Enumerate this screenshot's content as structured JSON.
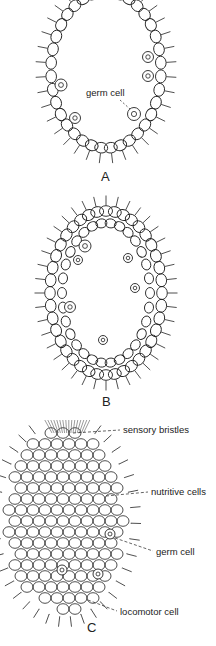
{
  "figures": [
    {
      "id": "A",
      "letter": "A",
      "labels": [
        {
          "text": "germ cell"
        }
      ]
    },
    {
      "id": "B",
      "letter": "B",
      "labels": []
    },
    {
      "id": "C",
      "letter": "C",
      "labels": [
        {
          "text": "sensory bristles"
        },
        {
          "text": "nutritive cells"
        },
        {
          "text": "germ cell"
        },
        {
          "text": "locomotor cell"
        }
      ]
    }
  ],
  "colors": {
    "ink": "#222222",
    "background": "#ffffff"
  }
}
